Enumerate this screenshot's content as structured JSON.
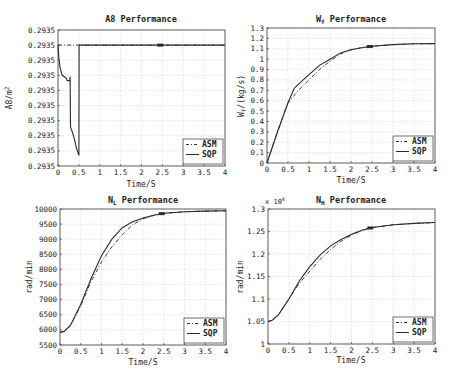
{
  "chart_data": [
    {
      "type": "line",
      "title": "A8 Performance",
      "xlabel": "Time/S",
      "ylabel": "A8/m^2",
      "xlim": [
        0,
        4
      ],
      "ylim": [
        0,
        9
      ],
      "xticks": [
        "0",
        "0.5",
        "1",
        "1.5",
        "2",
        "2.5",
        "3",
        "3.5",
        "4"
      ],
      "yticks": [
        "0.2935",
        "0.2935",
        "0.2935",
        "0.2935",
        "0.2935",
        "0.2935",
        "0.2935",
        "0.2935",
        "0.2935",
        "0.2935"
      ],
      "ytick_note": "all ticks display the same rounded value 0.2935 (10 ticks); series values given in tick-index units",
      "grid": true,
      "legend_position": "lower right",
      "series": [
        {
          "name": "ASM",
          "style": "dash-dot",
          "x": [
            0,
            4
          ],
          "y": [
            8,
            8
          ]
        },
        {
          "name": "SQP",
          "style": "solid",
          "x": [
            0,
            0.02,
            0.05,
            0.1,
            0.15,
            0.2,
            0.22,
            0.28,
            0.29,
            0.3,
            0.31,
            0.35,
            0.4,
            0.45,
            0.5,
            0.505,
            0.51,
            2.4,
            2.5,
            4
          ],
          "y": [
            8,
            7.2,
            6.5,
            6.0,
            5.9,
            5.8,
            5.65,
            5.65,
            5.9,
            2.6,
            2.5,
            2.2,
            1.7,
            1.1,
            0.7,
            8,
            8,
            8,
            8,
            8
          ]
        }
      ]
    },
    {
      "type": "line",
      "title": "Wf Performance",
      "xlabel": "Time/S",
      "ylabel": "Wf/(kg/s)",
      "xlim": [
        0,
        4
      ],
      "ylim": [
        0,
        1.3
      ],
      "xticks": [
        "0",
        "0.5",
        "1",
        "1.5",
        "2",
        "2.5",
        "3",
        "3.5",
        "4"
      ],
      "yticks": [
        "0",
        "0.1",
        "0.2",
        "0.3",
        "0.4",
        "0.5",
        "0.6",
        "0.7",
        "0.8",
        "0.9",
        "1",
        "1.1",
        "1.2",
        "1.3"
      ],
      "grid": true,
      "legend_position": "lower right",
      "series": [
        {
          "name": "ASM",
          "style": "dash-dot",
          "x": [
            0,
            0.25,
            0.5,
            0.75,
            1.0,
            1.25,
            1.5,
            1.75,
            2.0,
            2.25,
            2.5,
            3.0,
            3.5,
            4.0
          ],
          "y": [
            0,
            0.3,
            0.58,
            0.7,
            0.8,
            0.9,
            0.98,
            1.05,
            1.09,
            1.11,
            1.125,
            1.14,
            1.148,
            1.15
          ]
        },
        {
          "name": "SQP",
          "style": "solid",
          "x": [
            0,
            0.25,
            0.5,
            0.65,
            0.75,
            1.0,
            1.25,
            1.5,
            1.75,
            2.0,
            2.25,
            2.5,
            3.0,
            3.5,
            4.0
          ],
          "y": [
            0,
            0.3,
            0.58,
            0.72,
            0.76,
            0.85,
            0.94,
            1.0,
            1.06,
            1.09,
            1.11,
            1.125,
            1.14,
            1.148,
            1.15
          ]
        }
      ]
    },
    {
      "type": "line",
      "title": "NL Performance",
      "xlabel": "Time/S",
      "ylabel": "rad/min",
      "xlim": [
        0,
        4
      ],
      "ylim": [
        5500,
        10000
      ],
      "xticks": [
        "0",
        "0.5",
        "1",
        "1.5",
        "2",
        "2.5",
        "3",
        "3.5",
        "4"
      ],
      "yticks": [
        "5500",
        "6000",
        "6500",
        "7000",
        "7500",
        "8000",
        "8500",
        "9000",
        "9500",
        "10000"
      ],
      "grid": true,
      "legend_position": "lower right",
      "series": [
        {
          "name": "ASM",
          "style": "dash-dot",
          "x": [
            0,
            0.1,
            0.25,
            0.5,
            0.75,
            1.0,
            1.25,
            1.5,
            1.75,
            2.0,
            2.25,
            2.5,
            3.0,
            3.5,
            4.0
          ],
          "y": [
            5920,
            5950,
            6150,
            6800,
            7600,
            8250,
            8750,
            9150,
            9480,
            9680,
            9780,
            9850,
            9910,
            9930,
            9940
          ]
        },
        {
          "name": "SQP",
          "style": "solid",
          "x": [
            0,
            0.1,
            0.25,
            0.5,
            0.75,
            1.0,
            1.25,
            1.5,
            1.75,
            2.0,
            2.25,
            2.5,
            3.0,
            3.5,
            4.0
          ],
          "y": [
            5920,
            5950,
            6150,
            6850,
            7700,
            8450,
            9000,
            9380,
            9580,
            9700,
            9790,
            9860,
            9910,
            9930,
            9940
          ]
        }
      ]
    },
    {
      "type": "line",
      "title": "NH Performance",
      "xlabel": "Time/S",
      "ylabel": "rad/min",
      "y_multiplier": "x10^4",
      "xlim": [
        0,
        4
      ],
      "ylim": [
        1.0,
        1.3
      ],
      "xticks": [
        "0",
        "0.5",
        "1",
        "1.5",
        "2",
        "2.5",
        "3",
        "3.5",
        "4"
      ],
      "yticks": [
        "1",
        "1.05",
        "1.1",
        "1.15",
        "1.2",
        "1.25",
        "1.3"
      ],
      "grid": true,
      "legend_position": "lower right",
      "series": [
        {
          "name": "ASM",
          "style": "dash-dot",
          "x": [
            0,
            0.1,
            0.25,
            0.5,
            0.75,
            1.0,
            1.25,
            1.5,
            1.75,
            2.0,
            2.25,
            2.5,
            3.0,
            3.5,
            4.0
          ],
          "y": [
            1.05,
            1.053,
            1.065,
            1.1,
            1.135,
            1.162,
            1.188,
            1.21,
            1.228,
            1.242,
            1.252,
            1.259,
            1.265,
            1.268,
            1.27
          ]
        },
        {
          "name": "SQP",
          "style": "solid",
          "x": [
            0,
            0.1,
            0.25,
            0.5,
            0.75,
            1.0,
            1.25,
            1.5,
            1.75,
            2.0,
            2.25,
            2.5,
            3.0,
            3.5,
            4.0
          ],
          "y": [
            1.05,
            1.053,
            1.065,
            1.1,
            1.14,
            1.172,
            1.198,
            1.218,
            1.232,
            1.244,
            1.253,
            1.259,
            1.265,
            1.268,
            1.27
          ]
        }
      ]
    }
  ],
  "panels": [
    {
      "title": "A8 Performance",
      "title_main": "A8 Performance",
      "title_sub": "",
      "ylabel_main": "A8/m",
      "ylabel_sup": "2",
      "xlabel": "Time/S",
      "multiplier": ""
    },
    {
      "title_main": "W",
      "title_sub": "f",
      "title_rest": " Performance",
      "ylabel_main": "W",
      "ylabel_sub": "f",
      "ylabel_rest": "/(kg/s)",
      "xlabel": "Time/S",
      "multiplier": ""
    },
    {
      "title_main": "N",
      "title_sub": "L",
      "title_rest": " Performance",
      "ylabel_main": "rad/min",
      "xlabel": "Time/S",
      "multiplier": ""
    },
    {
      "title_main": "N",
      "title_sub": "H",
      "title_rest": " Performance",
      "ylabel_main": "rad/min",
      "xlabel": "Time/S",
      "multiplier_base": "x 10",
      "multiplier_exp": "4"
    }
  ],
  "legend": {
    "items": [
      "ASM",
      "SQP"
    ]
  },
  "colors": {
    "line": "#2a2a2a",
    "grid": "#c8c8c8",
    "axes": "#333333",
    "background": "#ffffff"
  }
}
